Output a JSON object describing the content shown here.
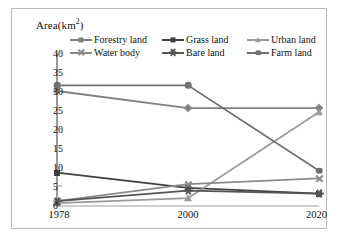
{
  "figure": {
    "y_axis_title": "Area(km",
    "y_axis_title_sup": "2",
    "y_axis_title_tail": ")"
  },
  "legend": {
    "position": "top",
    "rows": [
      [
        {
          "label": "Forestry land",
          "marker": "diamond",
          "color": "#808080"
        },
        {
          "label": "Grass land",
          "marker": "square",
          "color": "#404040"
        },
        {
          "label": "Urban land",
          "marker": "triangle",
          "color": "#9a9a9a"
        }
      ],
      [
        {
          "label": "Water body",
          "marker": "x",
          "color": "#8a8a8a"
        },
        {
          "label": "Bare land",
          "marker": "star",
          "color": "#555555"
        },
        {
          "label": "Farm land",
          "marker": "circle",
          "color": "#707070"
        }
      ]
    ]
  },
  "chart_data": {
    "type": "line",
    "title": "",
    "xlabel": "",
    "ylabel": "Area(km²)",
    "categories": [
      "1978",
      "2000",
      "2020"
    ],
    "x": [
      1978,
      2000,
      2020
    ],
    "ylim": [
      0,
      40
    ],
    "yticks": [
      0,
      5,
      10,
      15,
      20,
      25,
      30,
      35,
      40
    ],
    "grid": false,
    "legend_position": "top",
    "series": [
      {
        "name": "Forestry land",
        "marker": "diamond",
        "color": "#808080",
        "values": [
          30,
          25.5,
          25.5
        ]
      },
      {
        "name": "Grass land",
        "marker": "square",
        "color": "#404040",
        "values": [
          8.5,
          4.5,
          3
        ]
      },
      {
        "name": "Urban land",
        "marker": "triangle",
        "color": "#9a9a9a",
        "values": [
          0.5,
          1.8,
          24.5
        ]
      },
      {
        "name": "Water body",
        "marker": "x",
        "color": "#8a8a8a",
        "values": [
          1,
          5.5,
          7
        ]
      },
      {
        "name": "Bare land",
        "marker": "star",
        "color": "#555555",
        "values": [
          1,
          3.8,
          3
        ]
      },
      {
        "name": "Farm land",
        "marker": "circle",
        "color": "#707070",
        "values": [
          31.5,
          31.5,
          9
        ]
      }
    ]
  }
}
